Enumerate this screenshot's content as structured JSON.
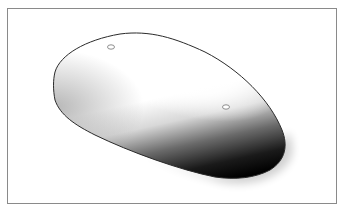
{
  "figure": {
    "frame_color": "#8a8a8a",
    "outline_color": "#2a2a2a",
    "shadow_color": "#000000",
    "holes": [
      {
        "name": "hole-front",
        "cx": 111,
        "cy": 47
      },
      {
        "name": "hole-rear",
        "cx": 226,
        "cy": 107
      }
    ]
  }
}
